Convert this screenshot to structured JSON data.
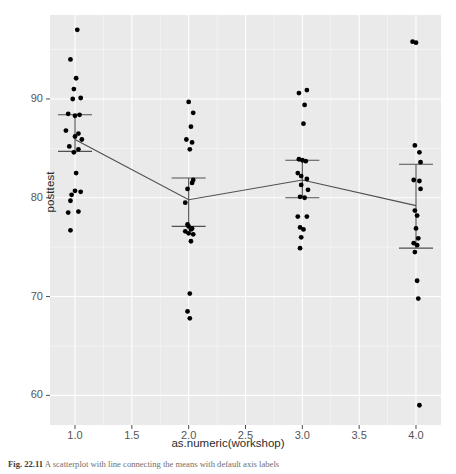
{
  "figure": {
    "caption_prefix": "Fig. 22.11",
    "caption_text": "A scatterplot with line connecting the means with default axis labels"
  },
  "chart_data": {
    "type": "scatter",
    "title": "",
    "xlabel": "as.numeric(workshop)",
    "ylabel": "posttest",
    "xlim": [
      0.78,
      4.22
    ],
    "ylim": [
      57.0,
      98.5
    ],
    "xticks": [
      "1.0",
      "1.5",
      "2.0",
      "2.5",
      "3.0",
      "3.5",
      "4.0"
    ],
    "xtick_values": [
      1.0,
      1.5,
      2.0,
      2.5,
      3.0,
      3.5,
      4.0
    ],
    "yticks": [
      "60",
      "70",
      "80",
      "90"
    ],
    "ytick_values": [
      60,
      70,
      80,
      90
    ],
    "grid": true,
    "grid_color": "#ffffff",
    "panel_background": "#eaeaea",
    "point_color": "#000000",
    "line_color": "#4f4f4f",
    "legend": "none",
    "series": [
      {
        "name": "posttest observations",
        "marker": "filled-circle",
        "points": [
          {
            "x": 1.02,
            "y": 97.0
          },
          {
            "x": 0.96,
            "y": 94.0
          },
          {
            "x": 1.01,
            "y": 92.1
          },
          {
            "x": 0.99,
            "y": 91.0
          },
          {
            "x": 1.05,
            "y": 90.1
          },
          {
            "x": 0.98,
            "y": 90.0
          },
          {
            "x": 0.94,
            "y": 88.5
          },
          {
            "x": 1.04,
            "y": 88.4
          },
          {
            "x": 1.0,
            "y": 88.3
          },
          {
            "x": 0.92,
            "y": 86.8
          },
          {
            "x": 1.03,
            "y": 86.5
          },
          {
            "x": 1.0,
            "y": 86.2
          },
          {
            "x": 1.06,
            "y": 85.9
          },
          {
            "x": 0.95,
            "y": 85.2
          },
          {
            "x": 1.03,
            "y": 84.9
          },
          {
            "x": 0.99,
            "y": 84.6
          },
          {
            "x": 1.01,
            "y": 82.5
          },
          {
            "x": 1.0,
            "y": 80.7
          },
          {
            "x": 1.05,
            "y": 80.6
          },
          {
            "x": 0.97,
            "y": 80.3
          },
          {
            "x": 0.96,
            "y": 79.7
          },
          {
            "x": 0.94,
            "y": 78.5
          },
          {
            "x": 1.03,
            "y": 78.6
          },
          {
            "x": 0.96,
            "y": 76.7
          },
          {
            "x": 2.0,
            "y": 89.7
          },
          {
            "x": 2.04,
            "y": 88.6
          },
          {
            "x": 2.02,
            "y": 87.2
          },
          {
            "x": 1.98,
            "y": 85.9
          },
          {
            "x": 2.03,
            "y": 85.6
          },
          {
            "x": 2.01,
            "y": 84.9
          },
          {
            "x": 2.04,
            "y": 81.8
          },
          {
            "x": 2.03,
            "y": 81.5
          },
          {
            "x": 1.99,
            "y": 80.9
          },
          {
            "x": 1.97,
            "y": 79.5
          },
          {
            "x": 1.99,
            "y": 77.3
          },
          {
            "x": 2.0,
            "y": 77.1
          },
          {
            "x": 2.03,
            "y": 76.9
          },
          {
            "x": 2.02,
            "y": 76.8
          },
          {
            "x": 1.97,
            "y": 76.6
          },
          {
            "x": 2.0,
            "y": 76.4
          },
          {
            "x": 2.04,
            "y": 76.3
          },
          {
            "x": 2.02,
            "y": 75.6
          },
          {
            "x": 2.01,
            "y": 70.3
          },
          {
            "x": 1.99,
            "y": 68.5
          },
          {
            "x": 2.01,
            "y": 67.8
          },
          {
            "x": 2.97,
            "y": 90.6
          },
          {
            "x": 3.04,
            "y": 90.9
          },
          {
            "x": 3.02,
            "y": 89.4
          },
          {
            "x": 3.01,
            "y": 87.5
          },
          {
            "x": 2.97,
            "y": 83.9
          },
          {
            "x": 3.0,
            "y": 83.8
          },
          {
            "x": 3.03,
            "y": 83.7
          },
          {
            "x": 2.96,
            "y": 82.5
          },
          {
            "x": 2.99,
            "y": 82.2
          },
          {
            "x": 3.04,
            "y": 81.9
          },
          {
            "x": 2.99,
            "y": 81.3
          },
          {
            "x": 3.05,
            "y": 80.8
          },
          {
            "x": 2.98,
            "y": 80.1
          },
          {
            "x": 3.02,
            "y": 80.0
          },
          {
            "x": 2.96,
            "y": 78.1
          },
          {
            "x": 3.04,
            "y": 78.1
          },
          {
            "x": 2.98,
            "y": 77.0
          },
          {
            "x": 3.01,
            "y": 76.8
          },
          {
            "x": 2.99,
            "y": 76.0
          },
          {
            "x": 2.98,
            "y": 74.9
          },
          {
            "x": 3.97,
            "y": 95.8
          },
          {
            "x": 4.0,
            "y": 95.7
          },
          {
            "x": 3.99,
            "y": 85.3
          },
          {
            "x": 4.03,
            "y": 84.6
          },
          {
            "x": 4.04,
            "y": 83.6
          },
          {
            "x": 3.98,
            "y": 81.8
          },
          {
            "x": 4.03,
            "y": 81.7
          },
          {
            "x": 4.04,
            "y": 80.9
          },
          {
            "x": 3.99,
            "y": 78.7
          },
          {
            "x": 4.01,
            "y": 78.2
          },
          {
            "x": 4.0,
            "y": 76.9
          },
          {
            "x": 4.02,
            "y": 75.9
          },
          {
            "x": 3.98,
            "y": 75.4
          },
          {
            "x": 4.01,
            "y": 75.2
          },
          {
            "x": 3.99,
            "y": 74.5
          },
          {
            "x": 4.01,
            "y": 71.6
          },
          {
            "x": 4.02,
            "y": 69.8
          },
          {
            "x": 4.03,
            "y": 59.0
          }
        ]
      }
    ],
    "means": {
      "name": "group means connected by line",
      "x": [
        1,
        2,
        3,
        4
      ],
      "y": [
        85.9,
        79.8,
        81.8,
        79.2
      ]
    },
    "error_bars": [
      {
        "x": 1,
        "upper": 88.4,
        "lower": 84.7
      },
      {
        "x": 2,
        "upper": 82.0,
        "lower": 77.1
      },
      {
        "x": 3,
        "upper": 83.8,
        "lower": 80.0
      },
      {
        "x": 4,
        "upper": 83.4,
        "lower": 74.9
      }
    ]
  }
}
